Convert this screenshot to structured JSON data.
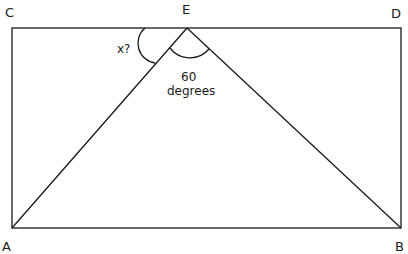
{
  "diagram": {
    "points": {
      "C": "C",
      "E": "E",
      "D": "D",
      "A": "A",
      "B": "B"
    },
    "angle_unknown_label": "x?",
    "angle_known_value": "60",
    "angle_known_unit": "degrees",
    "stroke_color": "#1a1a1a",
    "background": "#ffffff"
  }
}
